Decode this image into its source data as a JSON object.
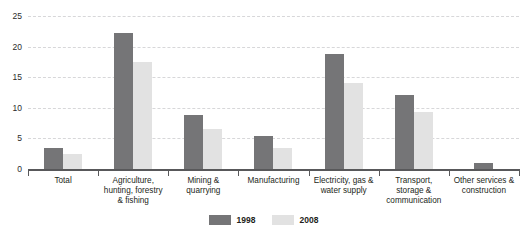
{
  "chart_data": {
    "type": "bar",
    "title": "",
    "xlabel": "",
    "ylabel": "",
    "ylim": [
      0,
      25
    ],
    "yticks": [
      0,
      5,
      10,
      15,
      20,
      25
    ],
    "grid": true,
    "legend_position": "bottom",
    "categories": [
      "Total",
      "Agriculture, hunting, forestry & fishing",
      "Mining & quarrying",
      "Manufacturing",
      "Electricity, gas & water supply",
      "Transport, storage & communication",
      "Other services & construction"
    ],
    "category_lines": [
      [
        "Total"
      ],
      [
        "Agriculture,",
        "hunting, forestry",
        "& fishing"
      ],
      [
        "Mining &",
        "quarrying"
      ],
      [
        "Manufacturing"
      ],
      [
        "Electricity, gas &",
        "water supply"
      ],
      [
        "Transport,",
        "storage &",
        "communication"
      ],
      [
        "Other services &",
        "construction"
      ]
    ],
    "series": [
      {
        "name": "1998",
        "color": "#757577",
        "values": [
          3.4,
          22.3,
          8.8,
          5.4,
          18.8,
          12.1,
          1.0
        ]
      },
      {
        "name": "2008",
        "color": "#e2e2e2",
        "values": [
          2.4,
          17.5,
          6.6,
          3.5,
          14.0,
          9.3,
          0.0
        ]
      }
    ]
  },
  "legend": {
    "items": [
      {
        "label": "1998",
        "color": "#757577"
      },
      {
        "label": "2008",
        "color": "#e2e2e2"
      }
    ]
  },
  "axis": {
    "y_tick_labels": [
      "0",
      "5",
      "10",
      "15",
      "20",
      "25"
    ]
  }
}
